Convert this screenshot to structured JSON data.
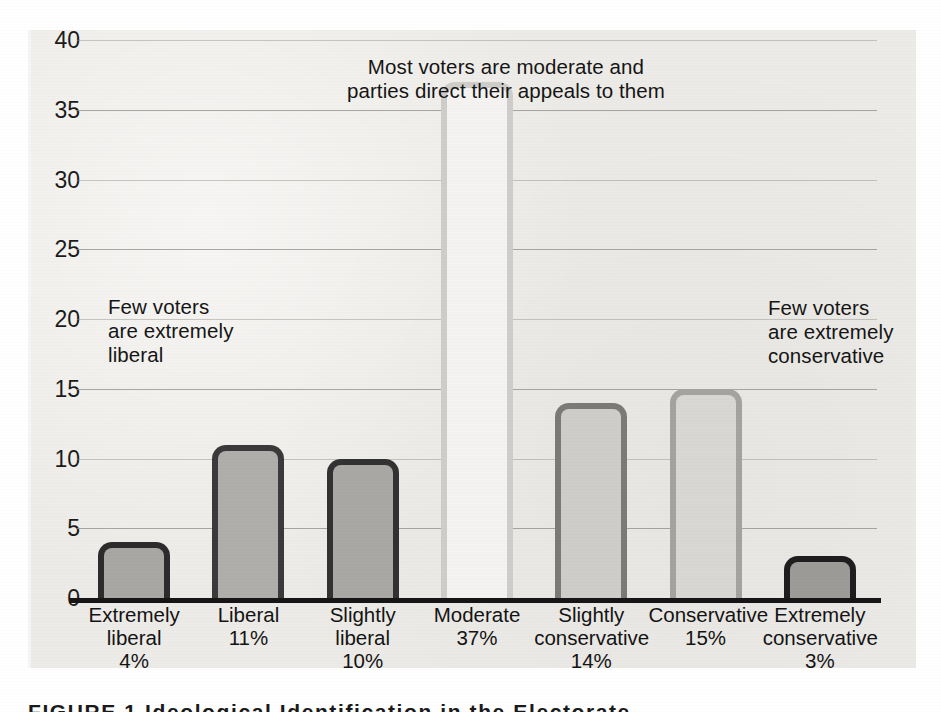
{
  "figure": {
    "caption": "FIGURE 1  Ideological Identification in the Electorate"
  },
  "chart_data": {
    "type": "bar",
    "title": "",
    "xlabel": "",
    "ylabel": "",
    "ylim": [
      0,
      40
    ],
    "ytick_step": 5,
    "grid": true,
    "legend": "none",
    "categories": [
      "Extremely\nliberal",
      "Liberal",
      "Slightly\nliberal",
      "Moderate",
      "Slightly\nconservative",
      "Conservative",
      "Extremely\nconservative"
    ],
    "value_labels": [
      "4%",
      "11%",
      "10%",
      "37%",
      "14%",
      "15%",
      "3%"
    ],
    "values": [
      4,
      11,
      10,
      37,
      14,
      15,
      3
    ],
    "yticks": [
      "0",
      "5",
      "10",
      "15",
      "20",
      "25",
      "30",
      "35",
      "40"
    ],
    "bar_styles": [
      {
        "fill": "#a9a7a4",
        "stroke": "#2c2c2c"
      },
      {
        "fill": "#b0aeab",
        "stroke": "#3a3a3a"
      },
      {
        "fill": "#aaa8a5",
        "stroke": "#323232"
      },
      {
        "fill": "#f4f3f1",
        "stroke": "#cfcdc9"
      },
      {
        "fill": "#cfcdc9",
        "stroke": "#7c7a77"
      },
      {
        "fill": "#d9d7d3",
        "stroke": "#a5a3a0"
      },
      {
        "fill": "#9d9b98",
        "stroke": "#1e1e1e"
      }
    ],
    "annotations": [
      {
        "id": "left-callout",
        "text": "Few voters\nare extremely\nliberal"
      },
      {
        "id": "top-callout",
        "text": "Most voters are moderate and\nparties direct their appeals to them"
      },
      {
        "id": "right-callout",
        "text": "Few voters\nare extremely\nconservative"
      }
    ],
    "colors": {
      "panel_background": "#edebe7",
      "page_background": "#ffffff",
      "gridline": "#8e8d8a",
      "axis": "#161616",
      "text": "#151515"
    }
  }
}
